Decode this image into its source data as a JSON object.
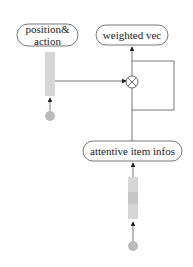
{
  "nodes": {
    "position_action": {
      "label_line1": "position&",
      "label_line2": "action"
    },
    "weighted_vec": {
      "label": "weighted vec"
    },
    "attentive_item_infos": {
      "label": "attentive item infos"
    }
  },
  "operator": {
    "symbol": "multiply-circle"
  },
  "colors": {
    "stroke": "#555555",
    "bar_fill": "#d6d6d6",
    "dot_fill": "#bbbbbb"
  }
}
